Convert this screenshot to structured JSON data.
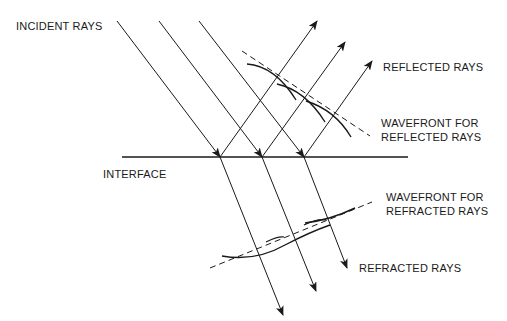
{
  "diagram": {
    "labels": {
      "incident": "INCIDENT RAYS",
      "reflected": "REFLECTED RAYS",
      "wavefront_reflected_1": "WAVEFRONT FOR",
      "wavefront_reflected_2": "REFLECTED RAYS",
      "interface": "INTERFACE",
      "wavefront_refracted_1": "WAVEFRONT FOR",
      "wavefront_refracted_2": "REFRACTED RAYS",
      "refracted": "REFRACTED RAYS"
    },
    "colors": {
      "line": "#1a1a1a",
      "background": "#ffffff"
    }
  }
}
